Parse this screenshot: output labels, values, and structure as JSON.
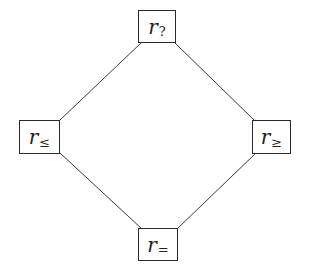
{
  "diagram": {
    "type": "lattice",
    "nodes": [
      {
        "id": "top",
        "variable": "r",
        "subscript": "?"
      },
      {
        "id": "left",
        "variable": "r",
        "subscript": "≤"
      },
      {
        "id": "right",
        "variable": "r",
        "subscript": "≥"
      },
      {
        "id": "bottom",
        "variable": "r",
        "subscript": "="
      }
    ],
    "edges": [
      {
        "from": "top",
        "to": "left"
      },
      {
        "from": "top",
        "to": "right"
      },
      {
        "from": "left",
        "to": "bottom"
      },
      {
        "from": "right",
        "to": "bottom"
      }
    ],
    "colors": {
      "line": "#3a3a3a",
      "border": "#2a2a2a",
      "text": "#222222",
      "background": "#ffffff"
    }
  }
}
